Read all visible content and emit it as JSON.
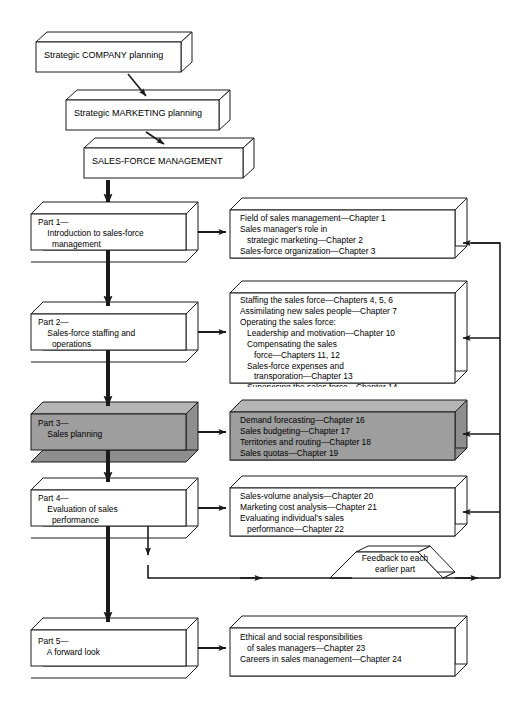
{
  "diagram": {
    "colors": {
      "line": "#1a1a1a",
      "box_fill": "#ffffff",
      "highlight_fill": "#9e9e9e",
      "side_fill": "#ffffff",
      "background": "#ffffff"
    }
  },
  "top_chain": [
    {
      "id": "strategic-company-planning",
      "label": "Strategic COMPANY planning"
    },
    {
      "id": "strategic-marketing-planning",
      "label": "Strategic MARKETING planning"
    },
    {
      "id": "sales-force-management",
      "label": "SALES-FORCE MANAGEMENT"
    }
  ],
  "parts": [
    {
      "id": "part-1",
      "highlighted": false,
      "title": "Part 1—",
      "subtitle": "Introduction to sales-force",
      "subtitle2": "management",
      "label": "Part 1—\n    Introduction to sales-force\n      management",
      "chapters_label": "Field of sales management—Chapter 1\nSales manager's role in\n   strategic marketing—Chapter 2\nSales-force organization—Chapter 3",
      "chapters": [
        "Field of sales management—Chapter 1",
        "Sales manager's role in",
        "   strategic marketing—Chapter 2",
        "Sales-force organization—Chapter 3"
      ]
    },
    {
      "id": "part-2",
      "highlighted": false,
      "title": "Part 2—",
      "subtitle": "Sales-force staffing and",
      "subtitle2": "operations",
      "label": "Part 2—\n    Sales-force staffing and\n      operations",
      "chapters_label": "Staffing the sales force—Chapters 4, 5, 6\nAssimilating new sales people—Chapter 7\nOperating the sales force:\n   Leadership and motivation—Chapter 10\n   Compensating the sales\n      force—Chapters 11, 12\n   Sales-force expenses and\n      transporation—Chapter 13\n   Supervising the sales force—Chapter 14\n   Sales-force morale—Chapter 15",
      "chapters": [
        "Staffing the sales force—Chapters 4, 5, 6",
        "Assimilating new sales people—Chapter 7",
        "Operating the sales force:",
        "   Leadership and motivation—Chapter 10",
        "   Compensating the sales",
        "      force—Chapters 11, 12",
        "   Sales-force expenses and",
        "      transporation—Chapter 13",
        "   Supervising the sales force—Chapter 14",
        "   Sales-force morale—Chapter 15"
      ]
    },
    {
      "id": "part-3",
      "highlighted": true,
      "title": "Part 3—",
      "subtitle": "Sales planning",
      "subtitle2": "",
      "label": "Part 3—\n    Sales planning",
      "chapters_label": "Demand forecasting—Chapter 16\nSales budgeting—Chapter 17\nTerritories and routing—Chapter 18\nSales quotas—Chapter 19",
      "chapters": [
        "Demand forecasting—Chapter 16",
        "Sales budgeting—Chapter 17",
        "Territories and routing—Chapter 18",
        "Sales quotas—Chapter 19"
      ]
    },
    {
      "id": "part-4",
      "highlighted": false,
      "title": "Part 4—",
      "subtitle": "Evaluation of sales",
      "subtitle2": "performance",
      "label": "Part 4—\n    Evaluation of sales\n      performance",
      "chapters_label": "Sales-volume analysis—Chapter 20\nMarketing cost analysis—Chapter 21\nEvaluating individual's sales\n   performance—Chapter 22",
      "chapters": [
        "Sales-volume analysis—Chapter 20",
        "Marketing cost analysis—Chapter 21",
        "Evaluating individual's sales",
        "   performance—Chapter 22"
      ]
    },
    {
      "id": "part-5",
      "highlighted": false,
      "title": "Part 5—",
      "subtitle": "A forward look",
      "subtitle2": "",
      "label": "Part 5—\n    A forward look",
      "chapters_label": "Ethical and social responsibilities\n   of sales managers—Chapter 23\nCareers in sales management—Chapter 24",
      "chapters": [
        "Ethical and social responsibilities",
        "   of sales managers—Chapter 23",
        "Careers in sales management—Chapter 24"
      ]
    }
  ],
  "feedback": {
    "id": "feedback-loop",
    "label": "Feedback to each\nearlier part",
    "line1": "Feedback to each",
    "line2": "earlier part"
  }
}
